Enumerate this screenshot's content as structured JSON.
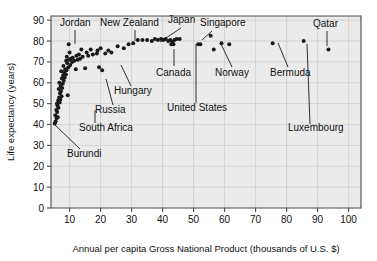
{
  "chart_data": {
    "type": "scatter",
    "title": "",
    "xlabel": "Annual per capita Gross National Product (thousands of U.S. $)",
    "ylabel": "Life expectancy (years)",
    "xlim": [
      4,
      104
    ],
    "ylim": [
      0,
      92
    ],
    "xticks": [
      10,
      20,
      30,
      40,
      50,
      60,
      70,
      80,
      90,
      100
    ],
    "yticks": [
      0,
      10,
      20,
      30,
      40,
      50,
      60,
      70,
      80,
      90
    ],
    "grid": true,
    "legend": "none",
    "points": [
      {
        "x": 5.2,
        "y": 40.5
      },
      {
        "x": 5.5,
        "y": 41.5
      },
      {
        "x": 5.8,
        "y": 43.0
      },
      {
        "x": 6.2,
        "y": 43.5
      },
      {
        "x": 5.4,
        "y": 44.5
      },
      {
        "x": 6.0,
        "y": 46.0
      },
      {
        "x": 5.7,
        "y": 47.0
      },
      {
        "x": 6.4,
        "y": 48.0
      },
      {
        "x": 6.1,
        "y": 49.0
      },
      {
        "x": 5.9,
        "y": 50.0
      },
      {
        "x": 6.8,
        "y": 50.5
      },
      {
        "x": 6.3,
        "y": 51.5
      },
      {
        "x": 7.0,
        "y": 52.0
      },
      {
        "x": 6.6,
        "y": 53.0
      },
      {
        "x": 7.4,
        "y": 53.5
      },
      {
        "x": 9.4,
        "y": 54.0
      },
      {
        "x": 6.9,
        "y": 55.0
      },
      {
        "x": 7.2,
        "y": 56.0
      },
      {
        "x": 6.5,
        "y": 57.0
      },
      {
        "x": 7.6,
        "y": 57.5
      },
      {
        "x": 7.1,
        "y": 58.5
      },
      {
        "x": 7.8,
        "y": 59.5
      },
      {
        "x": 6.7,
        "y": 60.0
      },
      {
        "x": 8.1,
        "y": 61.0
      },
      {
        "x": 7.5,
        "y": 62.0
      },
      {
        "x": 8.4,
        "y": 62.5
      },
      {
        "x": 7.9,
        "y": 63.5
      },
      {
        "x": 8.8,
        "y": 64.0
      },
      {
        "x": 8.2,
        "y": 65.0
      },
      {
        "x": 7.3,
        "y": 65.5
      },
      {
        "x": 9.0,
        "y": 66.0
      },
      {
        "x": 8.6,
        "y": 66.5
      },
      {
        "x": 12.0,
        "y": 66.5
      },
      {
        "x": 15.0,
        "y": 67.0
      },
      {
        "x": 20.5,
        "y": 66.0
      },
      {
        "x": 19.5,
        "y": 67.5
      },
      {
        "x": 9.6,
        "y": 67.5
      },
      {
        "x": 8.0,
        "y": 68.0
      },
      {
        "x": 10.2,
        "y": 68.5
      },
      {
        "x": 9.2,
        "y": 69.5
      },
      {
        "x": 10.8,
        "y": 70.0
      },
      {
        "x": 8.9,
        "y": 70.5
      },
      {
        "x": 11.5,
        "y": 70.5
      },
      {
        "x": 9.8,
        "y": 71.0
      },
      {
        "x": 12.6,
        "y": 71.0
      },
      {
        "x": 10.4,
        "y": 71.5
      },
      {
        "x": 13.4,
        "y": 71.5
      },
      {
        "x": 11.0,
        "y": 72.0
      },
      {
        "x": 14.2,
        "y": 72.5
      },
      {
        "x": 9.1,
        "y": 72.5
      },
      {
        "x": 12.2,
        "y": 73.0
      },
      {
        "x": 16.0,
        "y": 73.0
      },
      {
        "x": 17.5,
        "y": 73.5
      },
      {
        "x": 13.0,
        "y": 73.5
      },
      {
        "x": 18.8,
        "y": 74.0
      },
      {
        "x": 21.5,
        "y": 74.0
      },
      {
        "x": 10.0,
        "y": 74.5
      },
      {
        "x": 15.5,
        "y": 74.5
      },
      {
        "x": 23.5,
        "y": 74.5
      },
      {
        "x": 19.0,
        "y": 75.5
      },
      {
        "x": 22.5,
        "y": 75.5
      },
      {
        "x": 16.8,
        "y": 76.0
      },
      {
        "x": 13.8,
        "y": 76.0
      },
      {
        "x": 20.0,
        "y": 76.5
      },
      {
        "x": 9.7,
        "y": 78.5
      },
      {
        "x": 25.5,
        "y": 77.5
      },
      {
        "x": 27.5,
        "y": 76.5
      },
      {
        "x": 29.0,
        "y": 78.5
      },
      {
        "x": 30.5,
        "y": 79.0
      },
      {
        "x": 32.0,
        "y": 80.5
      },
      {
        "x": 33.5,
        "y": 80.5
      },
      {
        "x": 35.0,
        "y": 80.5
      },
      {
        "x": 36.5,
        "y": 80.0
      },
      {
        "x": 37.5,
        "y": 81.0
      },
      {
        "x": 38.5,
        "y": 80.5
      },
      {
        "x": 39.5,
        "y": 81.0
      },
      {
        "x": 40.2,
        "y": 80.5
      },
      {
        "x": 41.0,
        "y": 81.0
      },
      {
        "x": 41.8,
        "y": 80.0
      },
      {
        "x": 42.5,
        "y": 80.5
      },
      {
        "x": 43.2,
        "y": 79.5
      },
      {
        "x": 43.8,
        "y": 80.5
      },
      {
        "x": 44.5,
        "y": 81.0
      },
      {
        "x": 42.8,
        "y": 78.5
      },
      {
        "x": 43.5,
        "y": 78.5
      },
      {
        "x": 45.5,
        "y": 81.0
      },
      {
        "x": 51.5,
        "y": 78.5
      },
      {
        "x": 52.2,
        "y": 78.5
      },
      {
        "x": 55.5,
        "y": 82.5
      },
      {
        "x": 56.5,
        "y": 76.0
      },
      {
        "x": 59.0,
        "y": 79.0
      },
      {
        "x": 61.5,
        "y": 78.5
      },
      {
        "x": 75.5,
        "y": 79.0
      },
      {
        "x": 85.5,
        "y": 80.0
      },
      {
        "x": 93.5,
        "y": 76.0
      }
    ],
    "annotations": [
      {
        "label": "Jordan",
        "text_x": 60,
        "text_y": 26,
        "anchor": "start",
        "line": [
          [
            75,
            30
          ],
          [
            75,
            44
          ]
        ]
      },
      {
        "label": "New Zealand",
        "text_x": 100,
        "text_y": 26,
        "anchor": "start",
        "line": [
          [
            135,
            30
          ],
          [
            135,
            41
          ]
        ]
      },
      {
        "label": "Japan",
        "text_x": 168,
        "text_y": 23,
        "anchor": "start",
        "line": [
          [
            181,
            28
          ],
          [
            160,
            42
          ]
        ]
      },
      {
        "label": "Singapore",
        "text_x": 200,
        "text_y": 26,
        "anchor": "start",
        "line": [
          [
            212,
            31
          ],
          [
            202,
            40
          ]
        ]
      },
      {
        "label": "Qatar",
        "text_x": 313,
        "text_y": 27,
        "anchor": "start",
        "line": [
          [
            327,
            31
          ],
          [
            327,
            46
          ]
        ]
      },
      {
        "label": "Canada",
        "text_x": 156,
        "text_y": 76,
        "anchor": "start",
        "line": [
          [
            174,
            66
          ],
          [
            174,
            49
          ]
        ]
      },
      {
        "label": "Norway",
        "text_x": 215,
        "text_y": 76,
        "anchor": "start",
        "line": [
          [
            232,
            67
          ],
          [
            221,
            44
          ]
        ]
      },
      {
        "label": "Bermuda",
        "text_x": 270,
        "text_y": 76,
        "anchor": "start",
        "line": [
          [
            288,
            67
          ],
          [
            278,
            43
          ]
        ]
      },
      {
        "label": "United States",
        "text_x": 167,
        "text_y": 111,
        "anchor": "start",
        "line": [
          [
            196,
            103
          ],
          [
            196,
            44
          ]
        ]
      },
      {
        "label": "Luxembourg",
        "text_x": 288,
        "text_y": 131,
        "anchor": "start",
        "line": [
          [
            310,
            124
          ],
          [
            307,
            44
          ]
        ]
      },
      {
        "label": "Hungary",
        "text_x": 114,
        "text_y": 94,
        "anchor": "start",
        "line": [
          [
            131,
            86
          ],
          [
            121,
            65
          ]
        ]
      },
      {
        "label": "Russia",
        "text_x": 95,
        "text_y": 113,
        "anchor": "start",
        "line": [
          [
            113,
            105
          ],
          [
            106,
            79
          ]
        ]
      },
      {
        "label": "South Africa",
        "text_x": 79,
        "text_y": 131,
        "anchor": "start",
        "line": [
          [
            95,
            123
          ],
          [
            95,
            110
          ]
        ]
      },
      {
        "label": "Burundi",
        "text_x": 67,
        "text_y": 157,
        "anchor": "start",
        "line": [
          [
            80,
            149
          ],
          [
            54,
            124
          ]
        ]
      }
    ]
  }
}
